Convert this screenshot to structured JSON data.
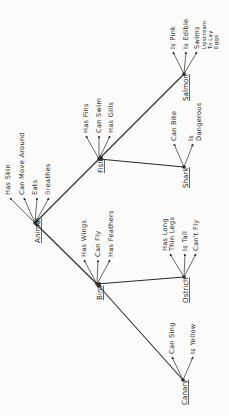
{
  "diagram": {
    "type": "semantic-network",
    "orientation": "rotated -90deg",
    "colors": {
      "ink": "#2a2a2a",
      "highlight_magenta": "#d040c0",
      "highlight_green": "#9ccf60"
    },
    "nodes": [
      {
        "id": "animal",
        "label": "Animal",
        "properties": [
          "Has Skin",
          "Can Move Around",
          "Eats",
          "Breathes"
        ]
      },
      {
        "id": "bird",
        "label": "Bird",
        "parent": "animal",
        "properties": [
          "Has Wings",
          "Can Fly",
          "Has Feathers"
        ]
      },
      {
        "id": "fish",
        "label": "Fish",
        "parent": "animal",
        "properties": [
          "Has Fins",
          "Can Swim",
          "Has Gills"
        ]
      },
      {
        "id": "canary",
        "label": "Canary",
        "parent": "bird",
        "properties": [
          "Can Sing",
          "Is Yellow"
        ]
      },
      {
        "id": "ostrich",
        "label": "Ostrich",
        "parent": "bird",
        "properties": [
          "Has Long Thin Legs",
          "Is Tall",
          "Can't Fly"
        ]
      },
      {
        "id": "shark",
        "label": "Shark",
        "parent": "fish",
        "properties": [
          "Can Bite",
          "Is Dangerous"
        ]
      },
      {
        "id": "salmon",
        "label": "Salmon",
        "parent": "fish",
        "properties": [
          "Is Pink",
          "Is Edible",
          "Swims Upstream To Lay Eggs"
        ]
      }
    ]
  },
  "labels": {
    "animal": "Animal",
    "bird": "Bird",
    "fish": "Fish",
    "canary": "Canary",
    "ostrich": "Ostrich",
    "shark": "Shark",
    "salmon": "Salmon",
    "has_skin": "Has Skin",
    "can_move_around": "Can Move Around",
    "eats": "Eats",
    "breathes_b": "Br",
    "breathes_rest": "eathes",
    "has_wings": "Has Wings",
    "can_fly": "Can Fly",
    "has_feathers": "Has Feathers",
    "has_fins": "Has Fins",
    "can_swim": "Can Swim",
    "has_gills": "Has Gills",
    "can_sing": "Can Sing",
    "is_yellow": "Is Yellow",
    "has_long": "Has Long",
    "thin_legs": "Thin Legs",
    "is_tall": "Is Tall",
    "cant_fly": "Can't Fly",
    "can_bite": "Can Bite",
    "is": "Is",
    "dangerous": "Dangerous",
    "is_pink": "Is Pink",
    "is_edible": "Is Edible",
    "swims": "Swims",
    "upstream": "Upstream",
    "to_lay": "To Lay",
    "eggs": "Eggs"
  }
}
